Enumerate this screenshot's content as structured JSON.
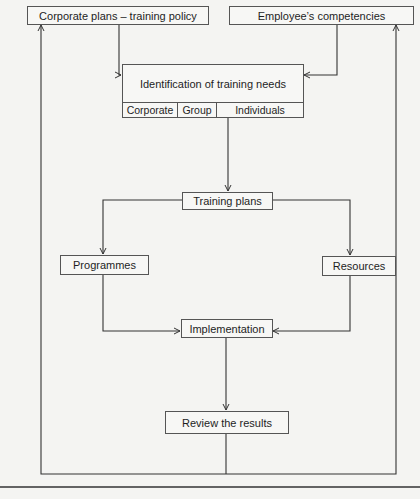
{
  "diagram": {
    "type": "flowchart",
    "nodes": {
      "corporate_plans": "Corporate plans – training policy",
      "employee_competencies": "Employee’s competencies",
      "identification": {
        "title": "Identification of training needs",
        "levels": [
          "Corporate",
          "Group",
          "Individuals"
        ]
      },
      "training_plans": "Training plans",
      "programmes": "Programmes",
      "resources": "Resources",
      "implementation": "Implementation",
      "review": "Review the results"
    },
    "edges": [
      {
        "from": "Corporate plans – training policy",
        "to": "Identification of training needs"
      },
      {
        "from": "Employee’s competencies",
        "to": "Identification of training needs"
      },
      {
        "from": "Identification of training needs",
        "to": "Training plans"
      },
      {
        "from": "Training plans",
        "to": "Programmes"
      },
      {
        "from": "Training plans",
        "to": "Resources"
      },
      {
        "from": "Programmes",
        "to": "Implementation"
      },
      {
        "from": "Resources",
        "to": "Implementation"
      },
      {
        "from": "Implementation",
        "to": "Review the results"
      },
      {
        "from": "Review the results",
        "to": "Corporate plans – training policy",
        "label": "feedback loop (left)"
      },
      {
        "from": "Review the results",
        "to": "Employee’s competencies",
        "label": "feedback loop (right)"
      }
    ]
  }
}
